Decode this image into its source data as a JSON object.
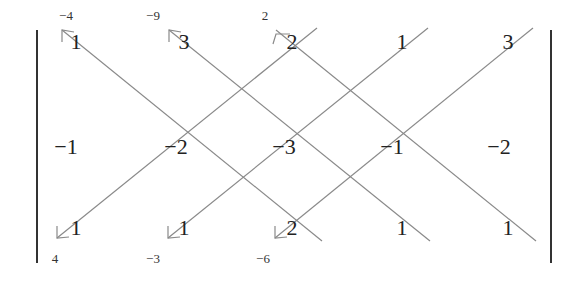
{
  "diagram": {
    "matrix_rows": [
      [
        "1",
        "3",
        "2",
        "1",
        "3"
      ],
      [
        "−1",
        "−2",
        "−3",
        "−1",
        "−2"
      ],
      [
        "1",
        "1",
        "2",
        "1",
        "1"
      ]
    ],
    "top_products": [
      "−4",
      "−9",
      "2"
    ],
    "bottom_products": [
      "4",
      "−3",
      "−6"
    ],
    "line_color": "#8a8a8a"
  }
}
